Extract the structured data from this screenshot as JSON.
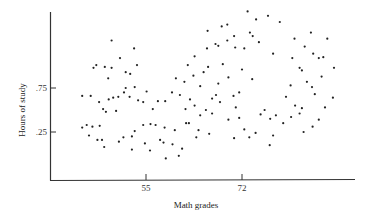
{
  "chart_data": {
    "type": "scatter",
    "title": "",
    "xlabel": "Math grades",
    "ylabel": "Hours of study",
    "xticks": [
      {
        "value": 55,
        "label": "55"
      },
      {
        "value": 72,
        "label": "72"
      }
    ],
    "yticks": [
      {
        "value": 0.25,
        "label": ".25"
      },
      {
        "value": 0.75,
        "label": ".75"
      }
    ],
    "xlim": [
      38.2,
      92.2
    ],
    "ylim": [
      -0.307,
      1.659
    ],
    "grid": false,
    "legend": null,
    "points": [
      [
        43.7,
        0.66
      ],
      [
        45.2,
        0.66
      ],
      [
        43.7,
        0.3
      ],
      [
        44.5,
        0.33
      ],
      [
        45.5,
        0.31
      ],
      [
        46.8,
        0.32
      ],
      [
        44.9,
        0.21
      ],
      [
        46.4,
        0.16
      ],
      [
        47.2,
        0.16
      ],
      [
        47.6,
        0.08
      ],
      [
        47.4,
        0.51
      ],
      [
        46.7,
        0.59
      ],
      [
        47.9,
        0.48
      ],
      [
        45.7,
        0.98
      ],
      [
        46.2,
        1.01
      ],
      [
        47.7,
        0.99
      ],
      [
        48.9,
        0.98
      ],
      [
        48.3,
        0.86
      ],
      [
        48.9,
        1.29
      ],
      [
        50.4,
        1.09
      ],
      [
        52.2,
        0.91
      ],
      [
        51.4,
        0.93
      ],
      [
        51.4,
        0.75
      ],
      [
        52.9,
        1.2
      ],
      [
        53.4,
        1.01
      ],
      [
        53.0,
        0.76
      ],
      [
        49.2,
        0.64
      ],
      [
        50.1,
        0.65
      ],
      [
        48.4,
        0.62
      ],
      [
        49.7,
        0.49
      ],
      [
        51.1,
        0.7
      ],
      [
        52.1,
        0.65
      ],
      [
        53.6,
        0.61
      ],
      [
        55.1,
        0.71
      ],
      [
        54.5,
        0.59
      ],
      [
        56.2,
        0.51
      ],
      [
        57.1,
        0.6
      ],
      [
        58.4,
        0.6
      ],
      [
        54.5,
        0.33
      ],
      [
        53.0,
        0.26
      ],
      [
        55.8,
        0.34
      ],
      [
        56.7,
        0.33
      ],
      [
        58.3,
        0.3
      ],
      [
        52.5,
        0.2
      ],
      [
        51.0,
        0.19
      ],
      [
        50.2,
        0.14
      ],
      [
        52.5,
        0.05
      ],
      [
        54.8,
        0.12
      ],
      [
        57.5,
        0.16
      ],
      [
        58.1,
        0.13
      ],
      [
        55.7,
        0.04
      ],
      [
        60.1,
        0.27
      ],
      [
        62.1,
        0.35
      ],
      [
        62.6,
        0.35
      ],
      [
        59.6,
        0.7
      ],
      [
        61.0,
        0.67
      ],
      [
        62.8,
        0.62
      ],
      [
        62.0,
        0.51
      ],
      [
        63.6,
        0.55
      ],
      [
        60.3,
        0.86
      ],
      [
        61.8,
        0.82
      ],
      [
        63.4,
        0.89
      ],
      [
        64.6,
        0.77
      ],
      [
        65.2,
        0.93
      ],
      [
        66.0,
        0.99
      ],
      [
        63.6,
        1.11
      ],
      [
        62.4,
        1.01
      ],
      [
        65.8,
        1.2
      ],
      [
        67.3,
        1.25
      ],
      [
        67.8,
        1.23
      ],
      [
        65.9,
        1.4
      ],
      [
        68.4,
        1.45
      ],
      [
        69.4,
        1.47
      ],
      [
        70.6,
        1.34
      ],
      [
        70.8,
        1.21
      ],
      [
        72.4,
        1.2
      ],
      [
        73.4,
        1.38
      ],
      [
        73.9,
        1.34
      ],
      [
        74.5,
        1.53
      ],
      [
        75.0,
        1.27
      ],
      [
        77.5,
        1.14
      ],
      [
        72.0,
        0.96
      ],
      [
        73.8,
        0.85
      ],
      [
        69.6,
        0.87
      ],
      [
        70.5,
        0.66
      ],
      [
        71.5,
        0.7
      ],
      [
        70.9,
        0.53
      ],
      [
        68.1,
        0.59
      ],
      [
        67.4,
        0.67
      ],
      [
        66.7,
        0.63
      ],
      [
        66.7,
        0.46
      ],
      [
        65.6,
        0.5
      ],
      [
        64.6,
        0.44
      ],
      [
        69.6,
        0.39
      ],
      [
        71.5,
        0.41
      ],
      [
        72.4,
        0.28
      ],
      [
        75.3,
        0.45
      ],
      [
        76.0,
        0.5
      ],
      [
        77.0,
        0.4
      ],
      [
        78.0,
        0.44
      ],
      [
        74.4,
        0.24
      ],
      [
        73.3,
        0.19
      ],
      [
        76.9,
        0.1
      ],
      [
        79.3,
        0.35
      ],
      [
        80.7,
        0.42
      ],
      [
        79.8,
        0.65
      ],
      [
        81.4,
        0.55
      ],
      [
        82.6,
        0.52
      ],
      [
        80.6,
        0.78
      ],
      [
        82.6,
        0.95
      ],
      [
        83.5,
        0.82
      ],
      [
        82.2,
        0.98
      ],
      [
        84.4,
        0.76
      ],
      [
        84.6,
        1.14
      ],
      [
        80.9,
        1.09
      ],
      [
        84.2,
        1.38
      ],
      [
        86.4,
        1.1
      ],
      [
        86.1,
        0.88
      ],
      [
        81.3,
        1.31
      ],
      [
        83.1,
        1.22
      ],
      [
        78.7,
        1.5
      ],
      [
        76.6,
        1.57
      ],
      [
        73.0,
        1.62
      ],
      [
        69.4,
        1.29
      ],
      [
        68.6,
        1.02
      ],
      [
        67.8,
        0.8
      ],
      [
        66.2,
        0.23
      ],
      [
        63.9,
        0.19
      ],
      [
        61.4,
        0.06
      ],
      [
        60.8,
        -0.02
      ],
      [
        59.7,
        0.11
      ],
      [
        58.5,
        -0.05
      ],
      [
        64.3,
        0.27
      ],
      [
        70.6,
        0.18
      ],
      [
        77.5,
        0.21
      ],
      [
        82.2,
        0.46
      ],
      [
        82.9,
        0.25
      ],
      [
        84.5,
        0.31
      ],
      [
        85.6,
        0.39
      ],
      [
        86.7,
        0.53
      ],
      [
        88.1,
        0.64
      ],
      [
        84.9,
        0.68
      ],
      [
        85.6,
        1.09
      ],
      [
        87.1,
        1.31
      ],
      [
        88.3,
        0.98
      ]
    ],
    "px_points": [
      [
        81,
        148
      ],
      [
        87,
        148
      ],
      [
        81,
        180
      ],
      [
        86,
        177
      ],
      [
        91,
        178
      ],
      [
        98,
        177
      ],
      [
        85,
        186
      ],
      [
        95,
        191
      ],
      [
        99,
        191
      ],
      [
        102,
        199
      ],
      [
        101,
        162
      ],
      [
        97,
        154
      ],
      [
        104,
        164
      ],
      [
        89,
        131
      ],
      [
        92,
        129
      ],
      [
        100,
        130
      ],
      [
        107,
        131
      ],
      [
        103,
        141
      ],
      [
        107,
        103
      ],
      [
        116,
        120
      ],
      [
        126,
        136
      ],
      [
        121,
        134
      ],
      [
        121,
        150
      ],
      [
        130,
        110
      ],
      [
        133,
        127
      ],
      [
        130,
        149
      ],
      [
        110,
        160
      ],
      [
        115,
        159
      ],
      [
        105,
        162
      ],
      [
        113,
        173
      ],
      [
        119,
        154
      ],
      [
        125,
        158
      ],
      [
        134,
        162
      ],
      [
        142,
        153
      ],
      [
        139,
        164
      ],
      [
        148,
        171
      ],
      [
        153,
        163
      ],
      [
        161,
        163
      ],
      [
        139,
        191
      ],
      [
        130,
        197
      ],
      [
        146,
        190
      ],
      [
        151,
        191
      ],
      [
        159,
        193
      ],
      [
        127,
        202
      ],
      [
        118,
        203
      ],
      [
        114,
        207
      ],
      [
        127,
        215
      ],
      [
        140,
        209
      ],
      [
        153,
        206
      ],
      [
        156,
        208
      ],
      [
        143,
        216
      ],
      [
        168,
        198
      ],
      [
        179,
        191
      ],
      [
        182,
        191
      ],
      [
        165,
        160
      ],
      [
        173,
        163
      ],
      [
        183,
        167
      ],
      [
        179,
        177
      ],
      [
        188,
        173
      ],
      [
        169,
        147
      ],
      [
        177,
        150
      ],
      [
        186,
        144
      ],
      [
        193,
        154
      ],
      [
        196,
        140
      ],
      [
        201,
        135
      ],
      [
        188,
        125
      ],
      [
        181,
        134
      ],
      [
        200,
        117
      ],
      [
        209,
        113
      ],
      [
        211,
        114
      ],
      [
        201,
        100
      ],
      [
        215,
        96
      ],
      [
        220,
        94
      ],
      [
        227,
        106
      ],
      [
        228,
        117
      ],
      [
        237,
        118
      ],
      [
        243,
        102
      ],
      [
        246,
        106
      ],
      [
        249,
        89
      ],
      [
        252,
        112
      ],
      [
        266,
        123
      ],
      [
        235,
        136
      ],
      [
        245,
        145
      ],
      [
        221,
        144
      ],
      [
        227,
        162
      ],
      [
        232,
        158
      ],
      [
        229,
        174
      ],
      [
        213,
        168
      ],
      [
        209,
        161
      ],
      [
        205,
        165
      ],
      [
        205,
        180
      ],
      [
        199,
        176
      ],
      [
        193,
        181
      ],
      [
        221,
        186
      ],
      [
        232,
        184
      ],
      [
        237,
        196
      ],
      [
        253,
        180
      ],
      [
        257,
        176
      ],
      [
        263,
        184
      ],
      [
        268,
        181
      ],
      [
        248,
        199
      ],
      [
        242,
        203
      ],
      [
        262,
        211
      ],
      [
        276,
        189
      ],
      [
        284,
        183
      ],
      [
        279,
        163
      ],
      [
        288,
        172
      ],
      [
        295,
        174
      ],
      [
        284,
        154
      ],
      [
        295,
        139
      ],
      [
        300,
        151
      ],
      [
        293,
        137
      ],
      [
        305,
        156
      ],
      [
        307,
        122
      ],
      [
        286,
        127
      ],
      [
        304,
        104
      ],
      [
        317,
        128
      ],
      [
        315,
        147
      ],
      [
        288,
        108
      ],
      [
        298,
        116
      ],
      [
        274,
        95
      ],
      [
        262,
        89
      ],
      [
        242,
        85
      ],
      [
        221,
        114
      ],
      [
        216,
        138
      ],
      [
        211,
        157
      ],
      [
        202,
        207
      ],
      [
        189,
        211
      ],
      [
        175,
        223
      ],
      [
        172,
        230
      ],
      [
        166,
        219
      ],
      [
        159,
        234
      ],
      [
        192,
        196
      ],
      [
        227,
        204
      ],
      [
        266,
        201
      ],
      [
        293,
        178
      ],
      [
        297,
        196
      ],
      [
        306,
        191
      ],
      [
        312,
        183
      ],
      [
        318,
        171
      ],
      [
        326,
        162
      ],
      [
        308,
        158
      ],
      [
        312,
        121
      ],
      [
        321,
        103
      ],
      [
        328,
        131
      ]
    ]
  },
  "axes": {
    "x_label": "Math grades",
    "y_label": "Hours of study",
    "x_ticks": [
      {
        "label": "55",
        "px": 146
      },
      {
        "label": "72",
        "px": 242
      }
    ],
    "y_ticks": [
      {
        "label": ".75",
        "px": 88
      },
      {
        "label": ".25",
        "px": 132
      }
    ]
  }
}
